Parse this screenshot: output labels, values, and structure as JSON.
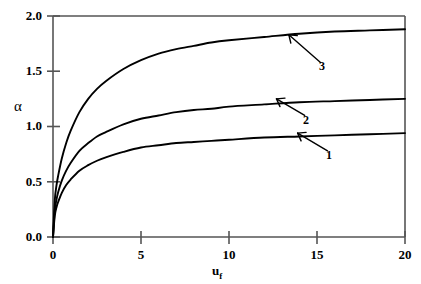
{
  "chart_data": {
    "type": "line",
    "title": "",
    "xlabel": "u_f",
    "xlabel_base": "u",
    "xlabel_sub": "f",
    "ylabel": "α",
    "xlim": [
      0,
      20
    ],
    "ylim": [
      0,
      2.0
    ],
    "grid": false,
    "legend": "inline annotations with arrows",
    "xticks": [
      0,
      5,
      10,
      15,
      20
    ],
    "xtick_labels": [
      "0",
      "5",
      "10",
      "15",
      "20"
    ],
    "yticks": [
      0.0,
      0.5,
      1.0,
      1.5,
      2.0
    ],
    "ytick_labels": [
      "0.0",
      "0.5",
      "1.0",
      "1.5",
      "2.0"
    ],
    "line_color": "#000000",
    "frame_color": "#555555",
    "background": "#ffffff",
    "x": [
      0,
      0.1,
      0.2,
      0.3,
      0.5,
      0.75,
      1,
      1.5,
      2,
      2.5,
      3,
      4,
      5,
      6,
      7,
      8,
      9,
      10,
      12,
      14,
      16,
      18,
      20
    ],
    "series": [
      {
        "name": "1",
        "label": "1",
        "asymptote": 0.95,
        "values": [
          0,
          0.19,
          0.27,
          0.32,
          0.4,
          0.47,
          0.52,
          0.6,
          0.65,
          0.69,
          0.72,
          0.77,
          0.81,
          0.83,
          0.85,
          0.86,
          0.87,
          0.88,
          0.9,
          0.91,
          0.92,
          0.93,
          0.94
        ]
      },
      {
        "name": "2",
        "label": "2",
        "asymptote": 1.25,
        "values": [
          0,
          0.24,
          0.34,
          0.41,
          0.51,
          0.6,
          0.67,
          0.78,
          0.85,
          0.91,
          0.95,
          1.02,
          1.07,
          1.1,
          1.13,
          1.15,
          1.16,
          1.18,
          1.2,
          1.22,
          1.23,
          1.24,
          1.25
        ]
      },
      {
        "name": "3",
        "label": "3",
        "asymptote": 1.88,
        "values": [
          0,
          0.33,
          0.47,
          0.56,
          0.71,
          0.85,
          0.96,
          1.13,
          1.25,
          1.34,
          1.41,
          1.52,
          1.6,
          1.66,
          1.7,
          1.73,
          1.76,
          1.78,
          1.81,
          1.84,
          1.86,
          1.87,
          1.88
        ]
      }
    ],
    "annotations": [
      {
        "label": "1",
        "text_x": 15.6,
        "text_y": 0.78,
        "arrow_tip_x": 13.9,
        "arrow_tip_y": 0.94
      },
      {
        "label": "2",
        "text_x": 14.3,
        "text_y": 1.1,
        "arrow_tip_x": 12.7,
        "arrow_tip_y": 1.25
      },
      {
        "label": "3",
        "text_x": 15.2,
        "text_y": 1.58,
        "arrow_tip_x": 13.4,
        "arrow_tip_y": 1.83
      }
    ]
  }
}
